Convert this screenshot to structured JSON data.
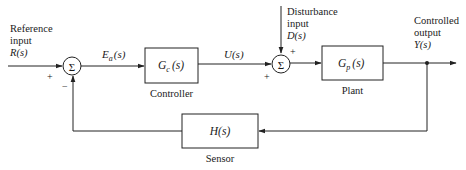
{
  "diagram": {
    "type": "feedback control system block diagram",
    "inputs": {
      "reference": {
        "line1": "Reference",
        "line2": "input",
        "symbol": "R(s)"
      },
      "disturbance": {
        "line1": "Disturbance",
        "line2": "input",
        "symbol": "D(s)"
      }
    },
    "output": {
      "line1": "Controlled",
      "line2": "output",
      "symbol": "Y(s)"
    },
    "summers": [
      {
        "id": "summer-1",
        "glyph": "Σ",
        "signs": {
          "left": "+",
          "bottom": "−"
        }
      },
      {
        "id": "summer-2",
        "glyph": "Σ",
        "signs": {
          "top": "+",
          "left": "+"
        }
      }
    ],
    "blocks": [
      {
        "id": "controller",
        "transfer": "G",
        "subscript": "c",
        "arg": "(s)",
        "label": "Controller"
      },
      {
        "id": "plant",
        "transfer": "G",
        "subscript": "p",
        "arg": "(s)",
        "label": "Plant"
      },
      {
        "id": "sensor",
        "transfer": "H(s)",
        "label": "Sensor"
      }
    ],
    "signals": {
      "error": {
        "main": "E",
        "subscript": "a",
        "arg": "(s)"
      },
      "control": "U(s)"
    },
    "colors": {
      "stroke": "#222222",
      "background": "#ffffff",
      "text": "#1a1a1a"
    }
  }
}
